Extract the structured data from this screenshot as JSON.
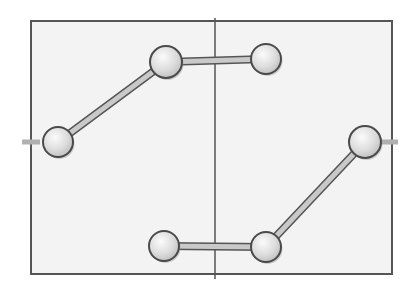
{
  "diagram": {
    "style": "pencil-sketch",
    "frame": {
      "x": 31,
      "y": 21,
      "width": 361,
      "height": 253,
      "fill": "#f3f3f3",
      "stroke": "#555555"
    },
    "center_line": {
      "x": 215,
      "y1": 18,
      "y2": 279,
      "stroke": "#555555"
    },
    "side_ticks": [
      {
        "x1": 22,
        "x2": 40,
        "y": 142
      },
      {
        "x1": 378,
        "x2": 398,
        "y": 142
      }
    ],
    "nodes": [
      {
        "id": "n1",
        "cx": 58,
        "cy": 142,
        "r": 15
      },
      {
        "id": "n2",
        "cx": 166,
        "cy": 62,
        "r": 16
      },
      {
        "id": "n3",
        "cx": 266,
        "cy": 59,
        "r": 15
      },
      {
        "id": "n4",
        "cx": 365,
        "cy": 142,
        "r": 16
      },
      {
        "id": "n5",
        "cx": 266,
        "cy": 247,
        "r": 15
      },
      {
        "id": "n6",
        "cx": 164,
        "cy": 246,
        "r": 15
      }
    ],
    "links": [
      {
        "from": "n1",
        "to": "n2"
      },
      {
        "from": "n2",
        "to": "n3"
      },
      {
        "from": "n4",
        "to": "n5"
      },
      {
        "from": "n5",
        "to": "n6"
      }
    ],
    "colors": {
      "node_fill_light": "#f4f4f4",
      "node_fill_dark": "#c8c8c8",
      "node_stroke": "#4a4a4a",
      "link_fill": "#c9c9c9",
      "link_stroke": "#555555"
    }
  }
}
